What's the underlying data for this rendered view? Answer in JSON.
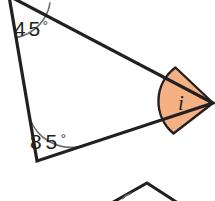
{
  "figure": {
    "type": "geometry-diagram",
    "background_color": "#ffffff",
    "stroke_color": "#231f20",
    "stroke_width": 3,
    "arc_color": "#53565a",
    "shade_color": "#f4b183",
    "shade_stroke": "#231f20"
  },
  "triangle": {
    "name": "main-triangle",
    "vertices": [
      {
        "id": "top-left",
        "x": 9,
        "y": -4
      },
      {
        "id": "bottom-left",
        "x": 37,
        "y": 161
      },
      {
        "id": "right",
        "x": 213,
        "y": 103
      }
    ]
  },
  "angles": [
    {
      "id": "angle-top-left",
      "value": "45",
      "degree_symbol": "°",
      "label": "45°",
      "known": true,
      "label_x": 14,
      "label_y": 36,
      "arc_radius": 42
    },
    {
      "id": "angle-bottom-left",
      "value": "85",
      "degree_symbol": "°",
      "label": "85°",
      "known": true,
      "label_x": 30,
      "label_y": 149,
      "arc_radius": 44
    },
    {
      "id": "angle-right-unknown",
      "value": "i",
      "label": "i",
      "known": false,
      "shaded": true,
      "label_x": 181,
      "label_y": 110,
      "arc_radius": 42
    }
  ],
  "partial_shape": {
    "name": "partial-triangle-below",
    "apex": {
      "x": 147,
      "y": 183
    },
    "left_point": {
      "x": 108,
      "y": 201
    },
    "right_point": {
      "x": 181,
      "y": 201
    },
    "clipped": true
  }
}
